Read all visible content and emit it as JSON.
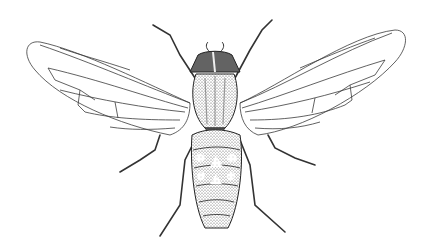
{
  "image": {
    "subject": "Fly (Diptera) dorsal view line drawing",
    "style": "stippled pen-and-ink scientific illustration",
    "background_color": "#ffffff",
    "ink_color": "#2a2a2a",
    "parts": [
      "head",
      "antennae",
      "thorax",
      "wings",
      "abdomen",
      "legs"
    ]
  }
}
